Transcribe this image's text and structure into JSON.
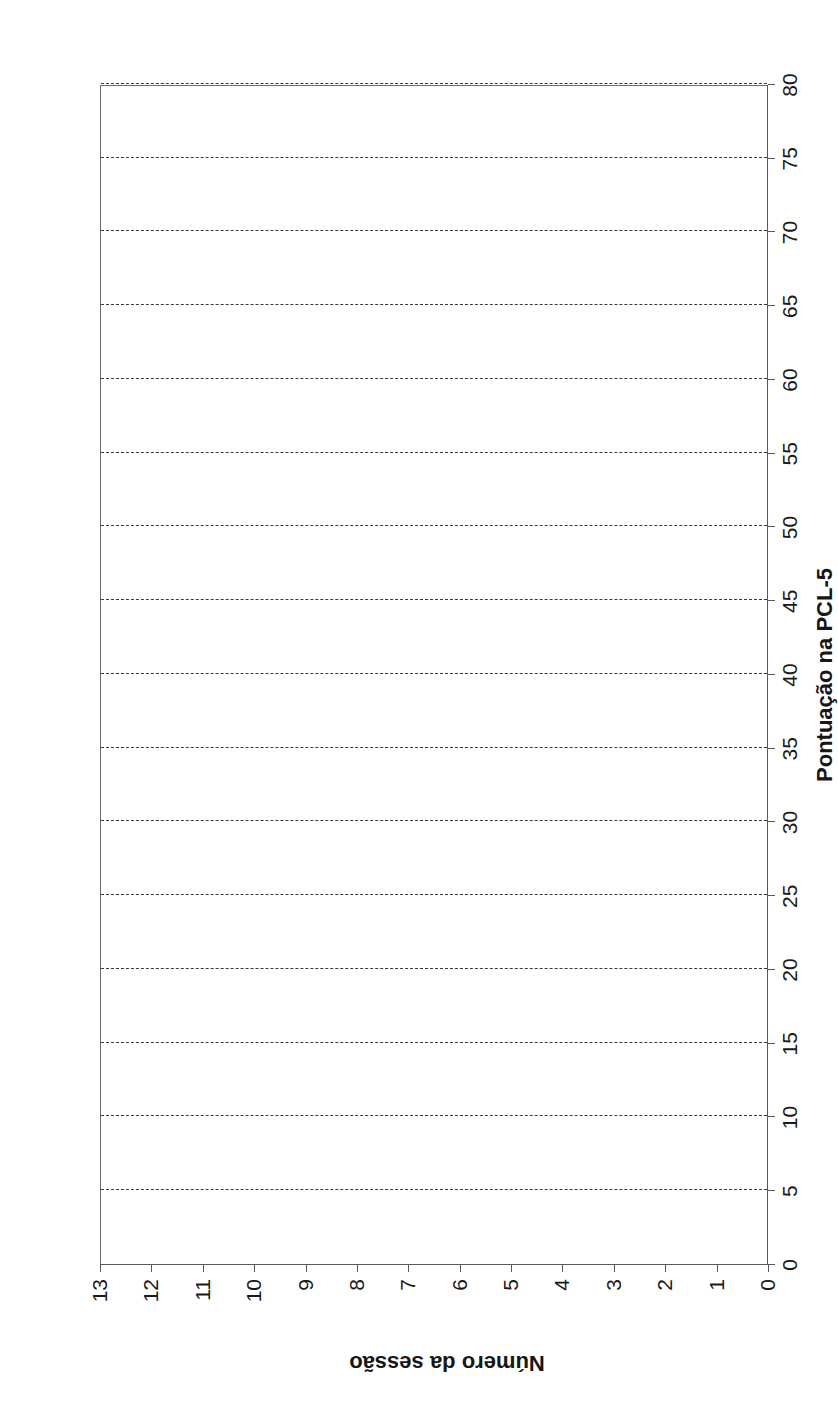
{
  "figure": {
    "background_color": "#ffffff",
    "axis_color": "#595959",
    "gridline_color": "#3a3a3a",
    "text_color": "#1a1a1a",
    "orientation": "rotated-90-ccw"
  },
  "chart_data": {
    "type": "line",
    "title": "",
    "subtitle": "",
    "xlabel": "Número da sessão",
    "ylabel": "Pontuação na PCL-5",
    "xlim": [
      0,
      13
    ],
    "ylim": [
      0,
      80
    ],
    "x_ticks": [
      0,
      1,
      2,
      3,
      4,
      5,
      6,
      7,
      8,
      9,
      10,
      11,
      12,
      13
    ],
    "x_tick_labels": [
      "0",
      "1",
      "2",
      "3",
      "4",
      "5",
      "6",
      "7",
      "8",
      "9",
      "10",
      "11",
      "12",
      "13"
    ],
    "y_ticks": [
      0,
      5,
      10,
      15,
      20,
      25,
      30,
      35,
      40,
      45,
      50,
      55,
      60,
      65,
      70,
      75,
      80
    ],
    "y_tick_labels": [
      "0",
      "5",
      "10",
      "15",
      "20",
      "25",
      "30",
      "35",
      "40",
      "45",
      "50",
      "55",
      "60",
      "65",
      "70",
      "75",
      "80"
    ],
    "grid": {
      "x_grid": false,
      "y_grid": true,
      "y_grid_style": "dashed",
      "y_grid_at": [
        5,
        10,
        15,
        20,
        25,
        30,
        35,
        40,
        45,
        50,
        55,
        60,
        65,
        70,
        75,
        80
      ]
    },
    "legend": {
      "show": false,
      "position": "none",
      "entries": []
    },
    "series": [],
    "x": [],
    "values": [],
    "annotations": [],
    "note": "Empty plotting template — axes, frame and dashed gridlines only; no data points, lines or markers are drawn."
  },
  "axes": {
    "value_axis": {
      "title": "Pontuação na PCL-5",
      "min": 0,
      "max": 80,
      "step": 5
    },
    "session_axis": {
      "title": "Número da sessão",
      "min": 0,
      "max": 13,
      "step": 1
    }
  }
}
